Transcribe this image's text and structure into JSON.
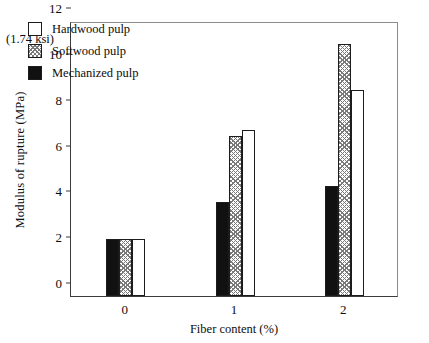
{
  "chart_data": {
    "type": "bar",
    "title": "",
    "xlabel": "Fiber content (%)",
    "ylabel": "Modulus of rupture (MPa)",
    "annotation": "(1.74 ksi)",
    "categories": [
      "0",
      "1",
      "2"
    ],
    "series": [
      {
        "name": "Mechanized  pulp",
        "fill": "black",
        "values": [
          2.5,
          4.1,
          4.8
        ]
      },
      {
        "name": "Softwood pulp",
        "fill": "hatch",
        "values": [
          2.5,
          7.0,
          11.0
        ]
      },
      {
        "name": "Hardwood pulp",
        "fill": "white",
        "values": [
          2.5,
          7.25,
          9.0
        ]
      }
    ],
    "ylim": [
      0,
      12
    ],
    "yticks": [
      "0",
      "2",
      "4",
      "6",
      "8",
      "10",
      "12"
    ],
    "ytick_values": [
      0,
      2,
      4,
      6,
      8,
      10,
      12
    ],
    "xlim": [
      0,
      3
    ],
    "grid": false,
    "legend_position": "upper left",
    "colors": {
      "axis": "#3b3b3b",
      "bar_outline": "#1c1c1c",
      "black_fill": "#111111",
      "hatch_stroke": "#7a7a7a",
      "white_fill": "#ffffff",
      "background": "#ffffff"
    }
  },
  "legend": {
    "items": [
      {
        "label": "Hardwood pulp",
        "fill": "white"
      },
      {
        "label": "Softwood pulp",
        "fill": "hatch"
      },
      {
        "label": "Mechanized  pulp",
        "fill": "black"
      }
    ]
  }
}
